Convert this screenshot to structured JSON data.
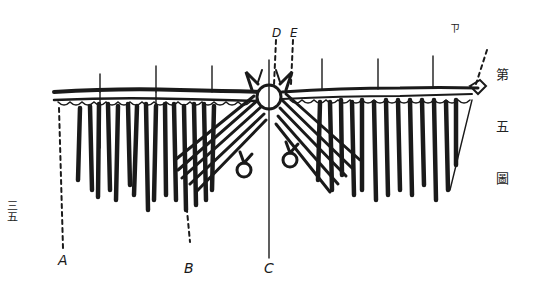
{
  "figure": {
    "caption_vertical": "第五圖",
    "caption_chars": [
      "第",
      "五",
      "圖"
    ],
    "page_number": "三五",
    "corner_mark": "ㄗ",
    "labels": {
      "A": "A",
      "B": "B",
      "C": "C",
      "D": "D",
      "E": "E"
    },
    "colors": {
      "ink": "#1a1a1a",
      "paper": "#ffffff"
    }
  }
}
